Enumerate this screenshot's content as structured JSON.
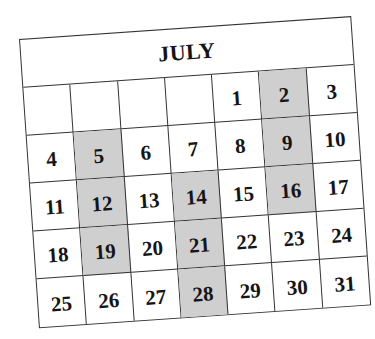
{
  "calendar": {
    "month": "JULY",
    "weeks": [
      [
        null,
        null,
        null,
        null,
        1,
        2,
        3
      ],
      [
        4,
        5,
        6,
        7,
        8,
        9,
        10
      ],
      [
        11,
        12,
        13,
        14,
        15,
        16,
        17
      ],
      [
        18,
        19,
        20,
        21,
        22,
        23,
        24
      ],
      [
        25,
        26,
        27,
        28,
        29,
        30,
        31
      ]
    ],
    "shaded_days": [
      2,
      5,
      9,
      12,
      14,
      16,
      19,
      21,
      28
    ],
    "shade_color": "#cfcfcf",
    "line_color": "#333333"
  }
}
